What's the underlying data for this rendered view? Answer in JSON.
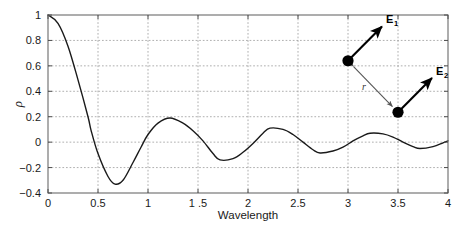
{
  "chart_data": {
    "type": "line",
    "title": "",
    "xlabel": "Wavelength",
    "ylabel": "ρ",
    "xlim": [
      0,
      4
    ],
    "ylim": [
      -0.4,
      1.0
    ],
    "grid": true,
    "legend": "none",
    "xticks": [
      0,
      0.5,
      1,
      1.5,
      2,
      2.5,
      3,
      3.5,
      4
    ],
    "xticklabels": [
      "0",
      "0.5",
      "1",
      "1 .5",
      "2",
      "2.5",
      "3",
      "3.5",
      "4"
    ],
    "yticks": [
      -0.4,
      -0.2,
      0,
      0.2,
      0.4,
      0.6,
      0.8,
      1
    ],
    "yticklabels": [
      "−0.4",
      "−0.2",
      "0",
      "0.2",
      "0.4",
      "0.6",
      "0.8",
      "1"
    ],
    "series": [
      {
        "name": "correlation",
        "color": "#1a1a1a",
        "linewidth": 1.4,
        "x": [
          0,
          0.1,
          0.2,
          0.3,
          0.4,
          0.43,
          0.5,
          0.6,
          0.67,
          0.75,
          0.85,
          0.93,
          1.0,
          1.1,
          1.22,
          1.35,
          1.45,
          1.55,
          1.65,
          1.72,
          1.85,
          1.95,
          2.05,
          2.15,
          2.22,
          2.35,
          2.45,
          2.55,
          2.65,
          2.72,
          2.85,
          2.95,
          3.05,
          3.15,
          3.22,
          3.35,
          3.45,
          3.55,
          3.65,
          3.72,
          3.85,
          3.95,
          4.0
        ],
        "y": [
          1.0,
          0.935,
          0.755,
          0.49,
          0.2,
          0.095,
          -0.09,
          -0.27,
          -0.33,
          -0.3,
          -0.16,
          -0.04,
          0.06,
          0.15,
          0.19,
          0.15,
          0.09,
          0.01,
          -0.09,
          -0.14,
          -0.13,
          -0.08,
          -0.01,
          0.07,
          0.11,
          0.1,
          0.06,
          0.0,
          -0.06,
          -0.085,
          -0.07,
          -0.04,
          0.01,
          0.05,
          0.07,
          0.065,
          0.04,
          0.0,
          -0.035,
          -0.05,
          -0.035,
          -0.005,
          0.01
        ]
      }
    ],
    "annotations": {
      "dipoles": [
        {
          "id": "dipole-1",
          "label": "E",
          "subscript": "1",
          "x": 3.0,
          "y": 0.64,
          "arrow_dx": 0.34,
          "arrow_dy": 0.27
        },
        {
          "id": "dipole-2",
          "label": "E",
          "subscript": "2",
          "x": 3.5,
          "y": 0.235,
          "arrow_dx": 0.34,
          "arrow_dy": 0.27
        }
      ],
      "separation": {
        "label": "r",
        "from_x": 3.0,
        "from_y": 0.64,
        "to_x": 3.5,
        "to_y": 0.235
      }
    }
  },
  "colors": {
    "curve": "#1a1a1a",
    "grid": "#9a9a9a",
    "axis": "#6b6b6b",
    "background": "#ffffff",
    "marker": "#000000",
    "vector": "#000000",
    "separation_arrow": "#555555"
  }
}
